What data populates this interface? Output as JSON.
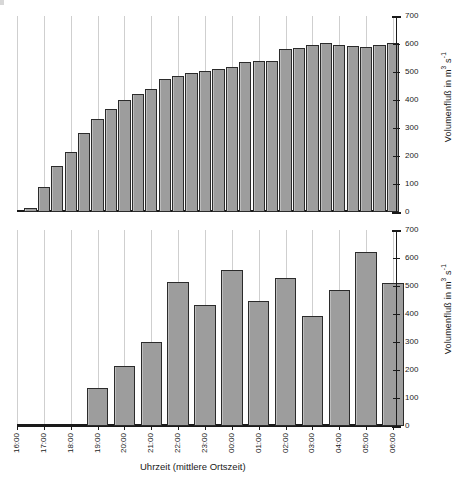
{
  "chart_data": [
    {
      "type": "bar",
      "panel": "upper",
      "title": "",
      "xlabel": "",
      "ylabel": "Volumenfluß in m3 s-1",
      "ylabel_base": "Volumenfluß in  m",
      "ylabel_sup1": "3",
      "ylabel_mid": " s",
      "ylabel_sup2": "-1",
      "ylim": [
        0,
        700
      ],
      "yticks": [
        0,
        100,
        200,
        300,
        400,
        500,
        600,
        700
      ],
      "xlim_hours": [
        "16:00",
        "06:00"
      ],
      "grid": "vertical-hourly",
      "legend": "none",
      "bar_interval_minutes": 30,
      "x": [
        "16:30",
        "17:00",
        "17:30",
        "18:00",
        "18:30",
        "19:00",
        "19:30",
        "20:00",
        "20:30",
        "21:00",
        "21:30",
        "22:00",
        "22:30",
        "23:00",
        "23:30",
        "00:00",
        "00:30",
        "01:00",
        "01:30",
        "02:00",
        "02:30",
        "03:00",
        "03:30",
        "04:00",
        "04:30",
        "05:00",
        "05:30",
        "06:00"
      ],
      "values": [
        15,
        88,
        163,
        213,
        283,
        332,
        369,
        400,
        421,
        441,
        474,
        487,
        496,
        505,
        512,
        519,
        537,
        539,
        541,
        583,
        587,
        598,
        603,
        595,
        593,
        589,
        595,
        602
      ]
    },
    {
      "type": "bar",
      "panel": "lower",
      "title": "",
      "xlabel": "Uhrzeit (mittlere Ortszeit)",
      "ylabel": "Volumenfluß in m3 s-1",
      "ylabel_base": "Volumenfluß in  m",
      "ylabel_sup1": "3",
      "ylabel_mid": " s",
      "ylabel_sup2": "-1",
      "ylim": [
        0,
        700
      ],
      "yticks": [
        0,
        100,
        200,
        300,
        400,
        500,
        600,
        700
      ],
      "xlim_hours": [
        "16:00",
        "06:00"
      ],
      "grid": "vertical-hourly",
      "legend": "none",
      "bar_interval_minutes": 60,
      "categories": [
        "16:00",
        "17:00",
        "18:00",
        "19:00",
        "20:00",
        "21:00",
        "22:00",
        "23:00",
        "00:00",
        "01:00",
        "02:00",
        "03:00",
        "04:00",
        "05:00",
        "06:00"
      ],
      "x": [
        "19:00",
        "20:00",
        "21:00",
        "22:00",
        "23:00",
        "00:00",
        "01:00",
        "02:00",
        "03:00",
        "04:00",
        "05:00",
        "06:00"
      ],
      "values": [
        135,
        215,
        300,
        513,
        432,
        558,
        447,
        527,
        393,
        486,
        620,
        510
      ]
    }
  ],
  "axes": {
    "xtick_labels": [
      "16:00",
      "17:00",
      "18:00",
      "19:00",
      "20:00",
      "21:00",
      "22:00",
      "23:00",
      "00:00",
      "01:00",
      "02:00",
      "03:00",
      "04:00",
      "05:00",
      "06:00"
    ],
    "ytick_labels": [
      "0",
      "100",
      "200",
      "300",
      "400",
      "500",
      "600",
      "700"
    ],
    "x_title": "Uhrzeit (mittlere Ortszeit)",
    "y_title_base": "Volumenfluß in  m",
    "y_title_sup1": "3",
    "y_title_mid": " s",
    "y_title_sup2": "-1"
  }
}
